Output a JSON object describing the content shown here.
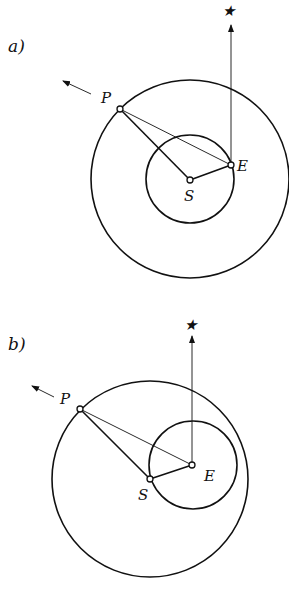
{
  "figure": {
    "background": "#ffffff",
    "ink": "#111111",
    "panels": [
      {
        "id": "a",
        "label": "a)",
        "label_pos": [
          8,
          52
        ],
        "outer_circle": {
          "cx": 190,
          "cy": 179,
          "r": 99
        },
        "inner_circle": {
          "cx": 190,
          "cy": 179,
          "r": 44
        },
        "points": {
          "S": {
            "label": "S",
            "x": 190,
            "y": 180,
            "label_x": 184,
            "label_y": 201
          },
          "E": {
            "label": "E",
            "x": 231,
            "y": 165,
            "label_x": 237,
            "label_y": 171
          },
          "P": {
            "label": "P",
            "x": 120,
            "y": 109,
            "label_x": 101,
            "label_y": 103
          }
        },
        "star": {
          "symbol": "★",
          "x": 229,
          "y": 14
        },
        "star_arrow": {
          "x": 231,
          "y1": 165,
          "y2": 25
        },
        "motion_arrow": {
          "x1": 91,
          "y1": 94,
          "x2": 63,
          "y2": 81
        }
      },
      {
        "id": "b",
        "label": "b)",
        "label_pos": [
          8,
          350
        ],
        "outer_circle": {
          "cx": 150,
          "cy": 479,
          "r": 98
        },
        "inner_circle": {
          "cx": 193,
          "cy": 465,
          "r": 44
        },
        "points": {
          "E": {
            "label": "E",
            "x": 192,
            "y": 465,
            "label_x": 204,
            "label_y": 481
          },
          "S": {
            "label": "S",
            "x": 150,
            "y": 479,
            "label_x": 138,
            "label_y": 500
          },
          "P": {
            "label": "P",
            "x": 80,
            "y": 409,
            "label_x": 60,
            "label_y": 404
          }
        },
        "star": {
          "symbol": "★",
          "x": 190,
          "y": 328
        },
        "star_arrow": {
          "x": 192,
          "y1": 465,
          "y2": 336
        },
        "motion_arrow": {
          "x1": 54,
          "y1": 397,
          "x2": 32,
          "y2": 386
        }
      }
    ]
  }
}
